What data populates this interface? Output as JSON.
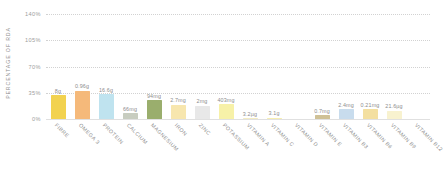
{
  "chart_data": {
    "type": "bar",
    "title": "",
    "xlabel": "",
    "ylabel": "PERCENTAGE OF RDA",
    "ylim": [
      0,
      140
    ],
    "yticks": [
      "0%",
      "35%",
      "70%",
      "105%",
      "140%"
    ],
    "ytick_values": [
      0,
      35,
      70,
      105,
      140
    ],
    "grid": true,
    "legend": false,
    "categories": [
      "FIBRE",
      "OMEGA 3",
      "PROTEIN",
      "CALCIUM",
      "MAGNESIUM",
      "IRON",
      "ZINC",
      "POTASSIUM",
      "VITAMIN A",
      "VITAMIN C",
      "VITAMIN D",
      "VITAMIN E",
      "VITAMIN B3",
      "VITAMIN B6",
      "VITAMIN B9",
      "VITAMIN B12"
    ],
    "values": [
      32,
      38,
      33,
      8,
      25,
      19,
      18,
      20,
      1,
      2,
      0,
      5,
      13,
      13,
      11,
      0
    ],
    "data_labels": [
      "8g",
      "0.96g",
      "16.6g",
      "66mg",
      "94mg",
      "2.7mg",
      "2mg",
      "403mg",
      "3.2µg",
      "3.1g",
      "",
      "0.7mg",
      "2.4mg",
      "0.21mg",
      "21.6µg",
      ""
    ],
    "bar_colors": [
      "#f2d24f",
      "#f5b97a",
      "#bfe3ef",
      "#c8cdc0",
      "#9aae6d",
      "#f7e6ae",
      "#e8e8e8",
      "#f7f1a8",
      "#f3ecc3",
      "#f6eeb0",
      "#ffffff",
      "#cfc196",
      "#c8dced",
      "#f3dfa0",
      "#f8f2cf",
      "#ffffff"
    ]
  },
  "axis": {
    "y_title": "PERCENTAGE OF RDA"
  }
}
